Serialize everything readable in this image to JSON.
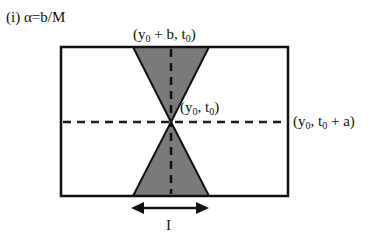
{
  "title": "(i) α=b/M",
  "labels": {
    "top": {
      "pre": "(y",
      "sub1": "0",
      "mid": " + b, t",
      "sub2": "0",
      "post": ")"
    },
    "center": {
      "pre": "(y",
      "sub1": "0",
      "mid": ", t",
      "sub2": "0",
      "post": ")"
    },
    "right": {
      "pre": "(y",
      "sub1": "0",
      "mid": ", t",
      "sub2": "0",
      "post": " + a)"
    },
    "interval": "I"
  },
  "colors": {
    "fill": "#7a7a7a",
    "stroke": "#111111",
    "dash": "#1a1a2e"
  },
  "geometry": {
    "rect": {
      "x": 61,
      "y": 47,
      "w": 227,
      "h": 149
    },
    "center": {
      "x": 171,
      "y": 122
    },
    "cone_half_width": 38,
    "arrow": {
      "x1": 131,
      "x2": 209,
      "y": 208
    }
  }
}
